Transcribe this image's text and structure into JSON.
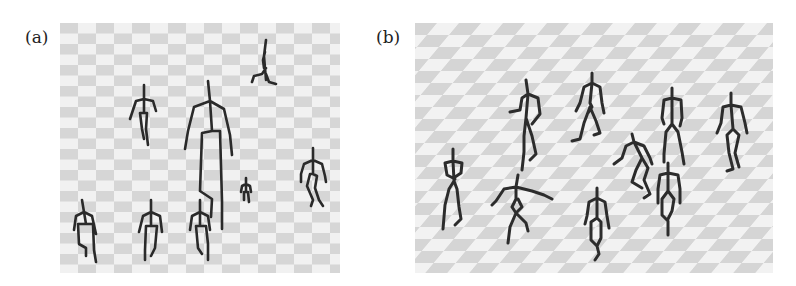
{
  "figure": {
    "panels": [
      {
        "id": "a",
        "label": "(a)",
        "description": "Stick-figure skeletons standing on a flat checkerboard floor viewed from above-front",
        "figure_count": 9
      },
      {
        "id": "b",
        "label": "(b)",
        "description": "Stick-figure skeletons in varied poses on a perspective checkerboard floor",
        "figure_count": 11
      }
    ],
    "colors": {
      "background": "#ffffff",
      "checker_light": "#f1f1f1",
      "checker_dark": "#d4d4d4",
      "skeleton": "#2a2a2a"
    }
  }
}
